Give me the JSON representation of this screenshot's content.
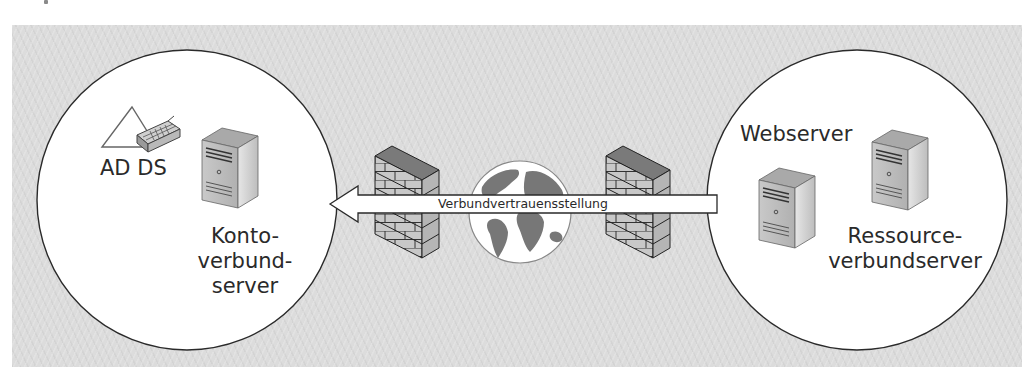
{
  "diagram": {
    "type": "federation-trust-diagram",
    "background_color": "#dcdcdc",
    "left_zone": {
      "label_adds": "AD DS",
      "label_server_lines": [
        "Konto-",
        "verbund-",
        "server"
      ],
      "icons": [
        "active-directory-icon",
        "server-tower-icon"
      ]
    },
    "right_zone": {
      "label_webserver": "Webserver",
      "label_resource_lines": [
        "Ressource-",
        "verbundserver"
      ],
      "icons": [
        "server-tower-icon",
        "server-tower-icon"
      ]
    },
    "connector": {
      "label": "Verbundvertrauensstellung",
      "direction": "right-to-left"
    },
    "middle_icons": [
      "firewall-icon",
      "globe-icon",
      "firewall-icon"
    ]
  }
}
